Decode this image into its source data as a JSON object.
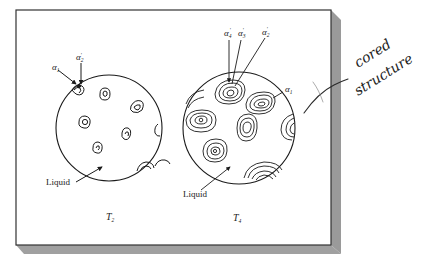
{
  "figure": {
    "panels": [
      {
        "id": "left",
        "temperature_label": "T",
        "temperature_subscript": "2",
        "phase_labels": [
          {
            "symbol": "α",
            "subscript": "1",
            "prime": false
          },
          {
            "symbol": "α",
            "subscript": "2",
            "prime": true
          }
        ],
        "region_label": "Liquid"
      },
      {
        "id": "right",
        "temperature_label": "T",
        "temperature_subscript": "4",
        "phase_labels": [
          {
            "symbol": "α",
            "subscript": "4",
            "prime": true
          },
          {
            "symbol": "α",
            "subscript": "3",
            "prime": true
          },
          {
            "symbol": "α",
            "subscript": "2",
            "prime": true
          },
          {
            "symbol": "α",
            "subscript": "1",
            "prime": false
          }
        ],
        "region_label": "Liquid"
      }
    ]
  },
  "annotation": {
    "handwritten_line1": "cored",
    "handwritten_line2": "structure"
  },
  "colors": {
    "card_face": "#ffffff",
    "card_border": "#333333",
    "card_shadow": "#9a9a9a",
    "ink": "#1a1a1a",
    "handwriting": "#2a2a2a"
  }
}
